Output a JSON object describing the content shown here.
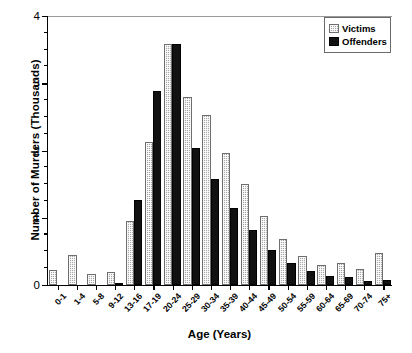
{
  "chart_data": {
    "type": "bar",
    "title": "",
    "xlabel": "Age (Years)",
    "ylabel": "Number of Murders (Thousands)",
    "categories": [
      "0-1",
      "1-4",
      "5-8",
      "9-12",
      "13-16",
      "17-19",
      "20-24",
      "25-29",
      "30-34",
      "35-39",
      "40-44",
      "45-49",
      "50-54",
      "55-59",
      "60-64",
      "65-69",
      "70-74",
      "75+"
    ],
    "series": [
      {
        "name": "Victims",
        "color": "#a9a9a9",
        "values": [
          0.23,
          0.45,
          0.17,
          0.19,
          0.95,
          2.13,
          3.58,
          2.8,
          2.53,
          1.97,
          1.5,
          1.03,
          0.68,
          0.43,
          0.3,
          0.32,
          0.24,
          0.47
        ]
      },
      {
        "name": "Offenders",
        "color": "#111111",
        "values": [
          0.0,
          0.0,
          0.0,
          0.03,
          1.27,
          2.88,
          3.58,
          2.03,
          1.57,
          1.15,
          0.82,
          0.52,
          0.33,
          0.21,
          0.14,
          0.12,
          0.06,
          0.08
        ]
      }
    ],
    "ylim": [
      0,
      4
    ],
    "yticks": [
      0,
      1,
      2,
      3,
      4
    ],
    "ytick_labels": [
      "0",
      "1",
      "2",
      "3",
      "4"
    ],
    "yminor_step": 0.25,
    "grid": false,
    "legend_position": "top-right"
  },
  "legend": {
    "items": [
      {
        "label": "Victims",
        "swatch": "victims-swatch"
      },
      {
        "label": "Offenders",
        "swatch": "offenders-swatch"
      }
    ]
  }
}
